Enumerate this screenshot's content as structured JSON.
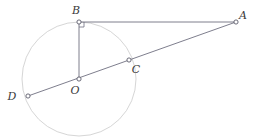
{
  "figure": {
    "type": "geometry-diagram",
    "canvas": {
      "width": 262,
      "height": 139
    },
    "colors": {
      "circle_stroke": "#d6d6d6",
      "line_stroke": "#6f6f80",
      "point_stroke": "#5a5a6a",
      "point_fill": "#ffffff",
      "label_fill": "#3a3a3a",
      "background": "#ffffff"
    },
    "circle": {
      "name": "circle-O",
      "center_label": "O",
      "cx": 79,
      "cy": 79,
      "r": 57,
      "stroke_width": 1
    },
    "points": [
      {
        "id": "B",
        "label": "B",
        "x": 79,
        "y": 22,
        "label_x": 76,
        "label_y": 14,
        "on_circle": true
      },
      {
        "id": "A",
        "label": "A",
        "x": 236,
        "y": 22,
        "label_x": 243,
        "label_y": 19,
        "on_circle": false
      },
      {
        "id": "C",
        "label": "C",
        "x": 129,
        "y": 60,
        "label_x": 136,
        "label_y": 73,
        "on_circle": true
      },
      {
        "id": "O",
        "label": "O",
        "x": 79,
        "y": 79,
        "label_x": 75,
        "label_y": 94,
        "on_circle": false
      },
      {
        "id": "D",
        "label": "D",
        "x": 28,
        "y": 96,
        "label_x": 12,
        "label_y": 100,
        "on_circle": true
      }
    ],
    "segments": [
      {
        "id": "BA",
        "name": "segment-ba",
        "from": "B",
        "to": "A",
        "x1": 79,
        "y1": 22,
        "x2": 236,
        "y2": 22
      },
      {
        "id": "BO",
        "name": "segment-bo",
        "from": "B",
        "to": "O",
        "x1": 79,
        "y1": 22,
        "x2": 79,
        "y2": 79
      },
      {
        "id": "DA",
        "name": "segment-da",
        "from": "D",
        "to": "A",
        "x1": 28,
        "y1": 96,
        "x2": 236,
        "y2": 22
      }
    ],
    "right_angle": {
      "id": "right-angle-B",
      "at_point": "B",
      "size": 5,
      "x": 79,
      "y": 22
    },
    "point_marker_radius": 2.1
  }
}
